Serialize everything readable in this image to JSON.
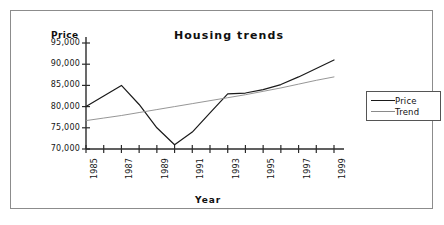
{
  "chart_data": {
    "type": "line",
    "title": "Housing trends",
    "xlabel": "Year",
    "ylabel": "Price",
    "xlim": [
      1985,
      1999
    ],
    "ylim": [
      70000,
      95000
    ],
    "grid": false,
    "legend_position": "right",
    "x": [
      1985,
      1986,
      1987,
      1988,
      1989,
      1990,
      1991,
      1992,
      1993,
      1994,
      1995,
      1996,
      1997,
      1998,
      1999
    ],
    "xtick_labels": [
      "1985",
      "1987",
      "1989",
      "1991",
      "1993",
      "1995",
      "1997",
      "1999"
    ],
    "xtick_values": [
      1985,
      1987,
      1989,
      1991,
      1993,
      1995,
      1997,
      1999
    ],
    "ytick_labels": [
      "95,000",
      "90,000",
      "85,000",
      "80,000",
      "75,000",
      "70,000"
    ],
    "ytick_values": [
      95000,
      90000,
      85000,
      80000,
      75000,
      70000
    ],
    "series": [
      {
        "name": "Price",
        "color": "#1a1a1a",
        "values": [
          80000,
          82500,
          85000,
          80500,
          75000,
          71000,
          74000,
          78500,
          83000,
          83200,
          84000,
          85200,
          87000,
          89000,
          91000
        ]
      },
      {
        "name": "Trend",
        "color": "#8a8a8a",
        "values": [
          76700,
          77300,
          77900,
          78600,
          79300,
          80000,
          80700,
          81400,
          82100,
          82800,
          83600,
          84400,
          85300,
          86200,
          87000
        ]
      }
    ]
  },
  "legend": {
    "items": [
      {
        "label": "Price"
      },
      {
        "label": "Trend"
      }
    ]
  }
}
